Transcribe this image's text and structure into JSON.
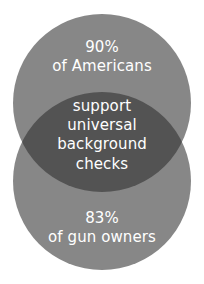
{
  "figure": {
    "name": "venn-diagram",
    "type": "venn-2-circle",
    "background_color": "#ffffff",
    "text_color": "#ffffff"
  },
  "chart_data": {
    "type": "venn",
    "title": "",
    "subtitle": "",
    "xlabel": "",
    "ylabel": "",
    "legend": [],
    "grid": false,
    "orientation": "vertical",
    "sets": [
      {
        "name": "Americans",
        "label_lines": [
          "90%",
          "of Americans"
        ],
        "value": 90,
        "value_label": "90%",
        "unit": "%",
        "color": "#878787",
        "position": "top"
      },
      {
        "name": "Gun owners",
        "label_lines": [
          "83%",
          "of gun owners"
        ],
        "value": 83,
        "value_label": "83%",
        "unit": "%",
        "color": "#878787",
        "position": "bottom"
      }
    ],
    "intersection": {
      "name": "support universal background checks",
      "label_lines": [
        "support",
        "universal",
        "background",
        "checks"
      ],
      "color": "#535353"
    }
  },
  "labels": {
    "top": {
      "line1": "90%",
      "line2": "of Americans"
    },
    "overlap": {
      "line1": "support",
      "line2": "universal",
      "line3": "background",
      "line4": "checks"
    },
    "bottom": {
      "line1": "83%",
      "line2": "of gun owners"
    }
  },
  "geometry": {
    "circle_top": {
      "cx": 102,
      "cy": 103,
      "r": 89
    },
    "circle_bottom": {
      "cx": 102,
      "cy": 181,
      "r": 89
    }
  }
}
